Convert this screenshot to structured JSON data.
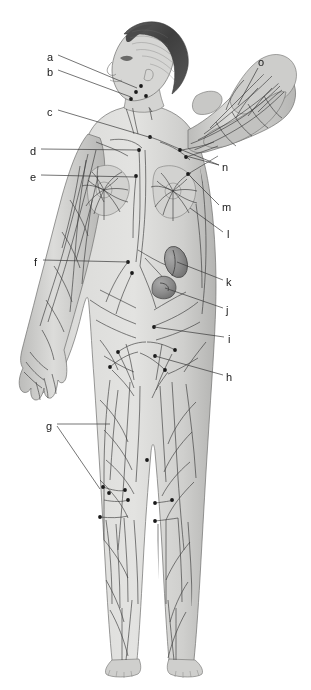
{
  "figure": {
    "pose": "right arm raised with hand behind head, left arm hanging at side",
    "background_color": "#ffffff",
    "ink_color": "#2b2b2b",
    "skin_fill": "#d8d8d6",
    "skin_shadow": "#b9b9b7",
    "hair_color": "#4a4a4a",
    "organ_fill": "#8f8f8f",
    "node_color": "#1a1a1a",
    "leader_color": "#3a3a3a"
  },
  "labels": [
    {
      "id": "a",
      "text": "a",
      "x": 47,
      "y": 52,
      "anchor_x": 137,
      "anchor_y": 88
    },
    {
      "id": "b",
      "text": "b",
      "x": 47,
      "y": 67,
      "anchor_x": 131,
      "anchor_y": 97
    },
    {
      "id": "c",
      "text": "c",
      "x": 47,
      "y": 107,
      "anchor_x": 150,
      "anchor_y": 137
    },
    {
      "id": "d",
      "text": "d",
      "x": 30,
      "y": 146,
      "anchor_x": 139,
      "anchor_y": 150
    },
    {
      "id": "e",
      "text": "e",
      "x": 30,
      "y": 172,
      "anchor_x": 136,
      "anchor_y": 176
    },
    {
      "id": "f",
      "text": "f",
      "x": 33,
      "y": 257,
      "anchor_x": 128,
      "anchor_y": 262
    },
    {
      "id": "g",
      "text": "g",
      "x": 46,
      "y": 421,
      "anchor_x": 110,
      "anchor_y": 425
    },
    {
      "id": "h",
      "text": "h",
      "x": 226,
      "y": 372,
      "anchor_x": 155,
      "anchor_y": 355
    },
    {
      "id": "i",
      "text": "i",
      "x": 227,
      "y": 334,
      "anchor_x": 155,
      "anchor_y": 326
    },
    {
      "id": "j",
      "text": "j",
      "x": 226,
      "y": 305,
      "anchor_x": 164,
      "anchor_y": 287
    },
    {
      "id": "k",
      "text": "k",
      "x": 226,
      "y": 277,
      "anchor_x": 176,
      "anchor_y": 262
    },
    {
      "id": "l",
      "text": "l",
      "x": 226,
      "y": 229,
      "anchor_x": 189,
      "anchor_y": 207
    },
    {
      "id": "m",
      "text": "m",
      "x": 222,
      "y": 202,
      "anchor_x": 188,
      "anchor_y": 174
    },
    {
      "id": "n",
      "text": "n",
      "x": 222,
      "y": 162,
      "anchor_x": 185,
      "anchor_y": 157
    },
    {
      "id": "o",
      "text": "o",
      "x": 258,
      "y": 57,
      "anchor_x": 238,
      "anchor_y": 103
    }
  ],
  "leader_lines": [
    {
      "label": "a",
      "points": "58,55 137,88"
    },
    {
      "label": "b",
      "points": "58,70 131,97"
    },
    {
      "label": "c",
      "points": "58,110 152,138"
    },
    {
      "label": "d",
      "points": "41,149 139,150"
    },
    {
      "label": "e",
      "points": "41,175 136,177"
    },
    {
      "label": "f",
      "points": "43,260 128,262"
    },
    {
      "label": "g1",
      "points": "57,424 110,424"
    },
    {
      "label": "g2",
      "points": "57,426 100,489"
    },
    {
      "label": "h",
      "points": "223,375 155,356"
    },
    {
      "label": "i",
      "points": "224,337 154,327"
    },
    {
      "label": "j",
      "points": "223,308 165,288"
    },
    {
      "label": "k",
      "points": "223,280 177,262"
    },
    {
      "label": "l",
      "points": "223,232 190,208"
    },
    {
      "label": "m",
      "points": "219,205 189,175"
    },
    {
      "label": "n1",
      "points": "219,165 186,156"
    },
    {
      "label": "n2",
      "points": "219,165 182,150"
    },
    {
      "label": "o",
      "points": "258,68 238,105"
    }
  ],
  "lymph_node_points": [
    {
      "x": 136,
      "y": 92
    },
    {
      "x": 131,
      "y": 99
    },
    {
      "x": 141,
      "y": 86
    },
    {
      "x": 146,
      "y": 96
    },
    {
      "x": 150,
      "y": 137
    },
    {
      "x": 139,
      "y": 150
    },
    {
      "x": 136,
      "y": 176
    },
    {
      "x": 180,
      "y": 150
    },
    {
      "x": 186,
      "y": 157
    },
    {
      "x": 188,
      "y": 174
    },
    {
      "x": 128,
      "y": 262
    },
    {
      "x": 132,
      "y": 273
    },
    {
      "x": 154,
      "y": 327
    },
    {
      "x": 155,
      "y": 356
    },
    {
      "x": 118,
      "y": 352
    },
    {
      "x": 175,
      "y": 350
    },
    {
      "x": 110,
      "y": 367
    },
    {
      "x": 165,
      "y": 370
    },
    {
      "x": 103,
      "y": 487
    },
    {
      "x": 109,
      "y": 493
    },
    {
      "x": 125,
      "y": 490
    },
    {
      "x": 128,
      "y": 500
    },
    {
      "x": 147,
      "y": 460
    },
    {
      "x": 155,
      "y": 503
    },
    {
      "x": 172,
      "y": 500
    },
    {
      "x": 100,
      "y": 517
    },
    {
      "x": 155,
      "y": 521
    }
  ],
  "organs": [
    {
      "name": "spleen",
      "label_ref": "k",
      "cx": 175,
      "cy": 262,
      "rx": 11,
      "ry": 16,
      "rot": -18
    },
    {
      "name": "kidney-cisterna",
      "label_ref": "j",
      "cx": 163,
      "cy": 288,
      "rx": 13,
      "ry": 10,
      "rot": 18
    }
  ]
}
